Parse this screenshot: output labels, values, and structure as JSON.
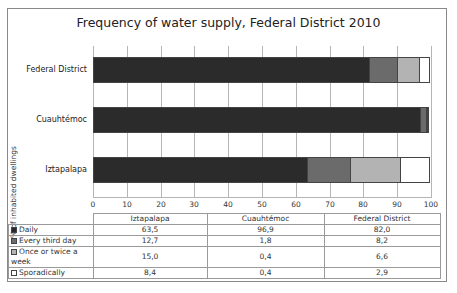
{
  "chart_data": {
    "type": "bar",
    "orientation": "horizontal",
    "stacked": true,
    "title": "Frequency of water supply, Federal District 2010",
    "xlabel": "",
    "ylabel": "% of inhabited dwellings",
    "xlim": [
      0,
      100
    ],
    "x_ticks": [
      "0",
      "10",
      "20",
      "30",
      "40",
      "50",
      "60",
      "70",
      "80",
      "90",
      "100"
    ],
    "grid": true,
    "legend_position": "data-table-below",
    "categories": [
      "Iztapalapa",
      "Cuauhtémoc",
      "Federal District"
    ],
    "series": [
      {
        "name": "Daily",
        "color": "#2b2b2b",
        "values": [
          63.5,
          96.9,
          82.0
        ],
        "labels": [
          "63,5",
          "96,9",
          "82,0"
        ]
      },
      {
        "name": "Every third day",
        "color": "#6b6b6b",
        "values": [
          12.7,
          1.8,
          8.2
        ],
        "labels": [
          "12,7",
          "1,8",
          "8,2"
        ]
      },
      {
        "name": "Once or twice a week",
        "color": "#b3b3b3",
        "values": [
          15.0,
          0.4,
          6.6
        ],
        "labels": [
          "15,0",
          "0,4",
          "6,6"
        ]
      },
      {
        "name": "Sporadically",
        "color": "#ffffff",
        "values": [
          8.4,
          0.4,
          2.9
        ],
        "labels": [
          "8,4",
          "0,4",
          "2,9"
        ]
      }
    ]
  }
}
